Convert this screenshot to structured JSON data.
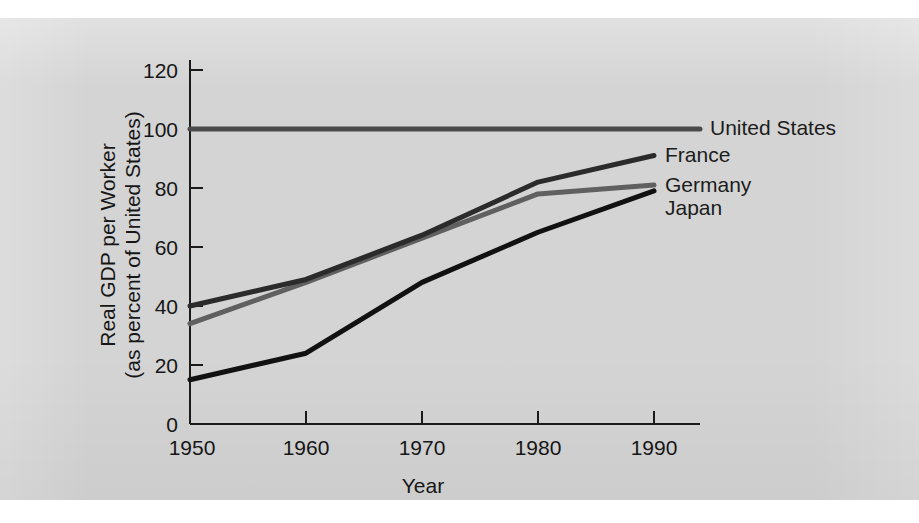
{
  "figure": {
    "background_color": "#d4d4d4",
    "page_color": "#ffffff"
  },
  "chart_data": {
    "type": "line",
    "title": "",
    "xlabel": "Year",
    "ylabel": "Real GDP per Worker (as percent of United States)",
    "ylabel_line1": "Real GDP per Worker",
    "ylabel_line2": "(as percent of United States)",
    "x": [
      1950,
      1960,
      1970,
      1980,
      1990
    ],
    "xticklabels": [
      "1950",
      "1960",
      "1970",
      "1980",
      "1990"
    ],
    "yticks": [
      0,
      20,
      40,
      60,
      80,
      100,
      120
    ],
    "yticklabels": [
      "0",
      "20",
      "40",
      "60",
      "80",
      "100",
      "120"
    ],
    "xlim": [
      1950,
      1993
    ],
    "ylim": [
      0,
      120
    ],
    "grid": false,
    "legend_position": "right-of-line-ends",
    "series": [
      {
        "name": "United States",
        "label": "United States",
        "color": "#4a4a4a",
        "linewidth": 5,
        "values": [
          100,
          100,
          100,
          100,
          100
        ]
      },
      {
        "name": "France",
        "label": "France",
        "color": "#2b2b2b",
        "linewidth": 5,
        "values": [
          40,
          49,
          64,
          82,
          91
        ]
      },
      {
        "name": "Germany",
        "label": "Germany",
        "color": "#606060",
        "linewidth": 5,
        "values": [
          34,
          48,
          63,
          78,
          81
        ]
      },
      {
        "name": "Japan",
        "label": "Japan",
        "color": "#111111",
        "linewidth": 5,
        "values": [
          15,
          24,
          48,
          65,
          79
        ]
      }
    ]
  }
}
